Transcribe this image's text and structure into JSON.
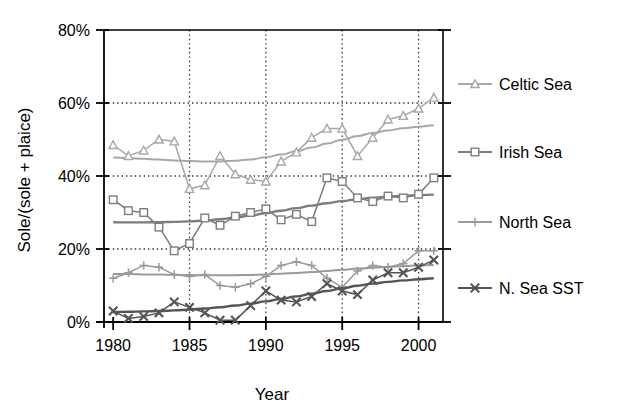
{
  "chart_data": {
    "type": "line",
    "title": "",
    "xlabel": "Year",
    "ylabel": "Sole/(sole + plaice)",
    "xlim": [
      1979.4,
      2001.6
    ],
    "ylim": [
      0,
      80
    ],
    "xticks": [
      1980,
      1985,
      1990,
      1995,
      2000
    ],
    "xtick_labels": [
      "1980",
      "1985",
      "1990",
      "1995",
      "2000"
    ],
    "yticks": [
      0,
      20,
      40,
      60,
      80
    ],
    "ytick_labels": [
      "0%",
      "20%",
      "40%",
      "60%",
      "80%"
    ],
    "grid": "dotted horizontal and vertical gridlines at major ticks",
    "legend_position": "right",
    "x": [
      1980,
      1981,
      1982,
      1983,
      1984,
      1985,
      1986,
      1987,
      1988,
      1989,
      1990,
      1991,
      1992,
      1993,
      1994,
      1995,
      1996,
      1997,
      1998,
      1999,
      2000,
      2001
    ],
    "series": [
      {
        "name": "Celtic Sea",
        "marker": "triangle",
        "color": "#a8a8a8",
        "values": [
          48.5,
          45.5,
          47.0,
          50.0,
          49.5,
          36.5,
          37.5,
          45.5,
          40.5,
          39.0,
          38.5,
          44.0,
          46.5,
          50.5,
          53.0,
          53.0,
          45.5,
          50.5,
          55.5,
          56.5,
          58.5,
          61.5
        ],
        "trend": {
          "start": 46.0,
          "min": 40.5,
          "end": 58.0,
          "description": "smooth fitted curve dipping near 1987 then rising"
        }
      },
      {
        "name": "Irish Sea",
        "marker": "square",
        "color": "#7d7d7d",
        "values": [
          33.5,
          30.5,
          30.0,
          26.0,
          19.5,
          21.5,
          28.5,
          26.5,
          29.0,
          30.0,
          31.0,
          28.0,
          29.5,
          27.5,
          39.5,
          38.5,
          34.0,
          33.0,
          34.5,
          34.0,
          35.0,
          39.5
        ],
        "trend": {
          "start": 26.5,
          "end": 38.5,
          "description": "smooth rising fitted curve"
        }
      },
      {
        "name": "North Sea",
        "marker": "plus",
        "color": "#9a9a9a",
        "values": [
          12.0,
          13.5,
          15.5,
          15.0,
          13.0,
          12.5,
          13.0,
          10.0,
          9.5,
          10.5,
          12.5,
          15.5,
          16.5,
          15.5,
          12.0,
          9.5,
          14.0,
          15.5,
          15.0,
          16.0,
          19.5,
          19.5
        ],
        "trend": {
          "start": 12.0,
          "end": 22.5,
          "description": "smooth rising fitted curve"
        }
      },
      {
        "name": "N. Sea SST",
        "marker": "x",
        "color": "#555555",
        "values": [
          3.0,
          1.0,
          1.5,
          2.5,
          5.5,
          4.0,
          2.5,
          0.5,
          0.5,
          4.5,
          8.5,
          6.0,
          5.5,
          7.0,
          10.5,
          8.5,
          7.5,
          11.5,
          13.5,
          13.5,
          15.0,
          17.0
        ],
        "trend": {
          "start": 4.0,
          "end": 15.5,
          "description": "smooth rising fitted curve"
        }
      }
    ]
  },
  "legend": {
    "items": [
      {
        "label": "Celtic Sea",
        "marker": "triangle-marker"
      },
      {
        "label": "Irish Sea",
        "marker": "square-marker"
      },
      {
        "label": "North Sea",
        "marker": "plus-marker"
      },
      {
        "label": "N. Sea SST",
        "marker": "x-marker"
      }
    ]
  },
  "colors": {
    "celtic": "#a8a8a8",
    "irish": "#7d7d7d",
    "north": "#9a9a9a",
    "sst": "#555555",
    "axis": "#000000",
    "grid": "#333333"
  }
}
